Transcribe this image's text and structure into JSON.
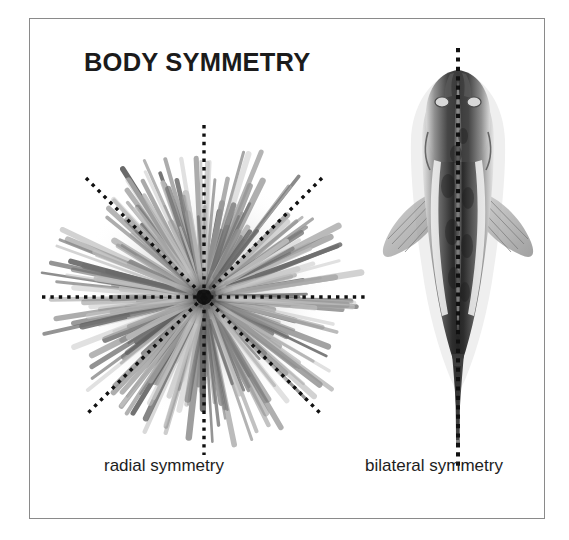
{
  "figure": {
    "title": "BODY SYMMETRY",
    "background_color": "#ffffff",
    "frame_color": "#8a8a8a",
    "ink_color": "#1b1b1b"
  },
  "panels": [
    {
      "id": "radial",
      "caption": "radial symmetry",
      "organism": "sea-urchin",
      "organism_view": "top view of a sea urchin with many radiating spines",
      "axis_style": "dotted",
      "axis_color": "#101010",
      "axis_count": 4,
      "axis_angles_deg": [
        0,
        45,
        90,
        135
      ],
      "center_x": 204,
      "center_y": 297
    },
    {
      "id": "bilateral",
      "caption": "bilateral symmetry",
      "organism": "catfish",
      "organism_view": "dorsal view of a fish with pectoral fins and long tail",
      "axis_style": "dotted",
      "axis_color": "#101010",
      "axis_count": 1,
      "axis_angles_deg": [
        90
      ],
      "center_x": 436,
      "center_y": 260
    }
  ]
}
